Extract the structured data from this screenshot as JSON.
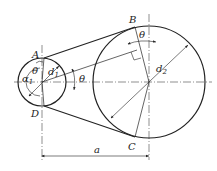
{
  "diagram": {
    "type": "belt-drive-geometry",
    "labels": {
      "A": "A",
      "B": "B",
      "C": "C",
      "D": "D",
      "theta": "θ",
      "alpha": "α",
      "alpha_sub": "1",
      "d": "d",
      "d1_sub": "1",
      "d2_sub": "2",
      "center_distance": "a"
    },
    "small_pulley": {
      "cx": 42,
      "cy": 82,
      "r": 24
    },
    "large_pulley": {
      "cx": 149,
      "cy": 82,
      "r": 56
    },
    "colors": {
      "stroke": "#222222",
      "background": "#ffffff"
    }
  }
}
